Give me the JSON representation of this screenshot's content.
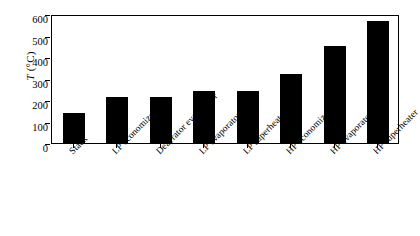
{
  "chart_data": {
    "type": "bar",
    "title": "",
    "subtitle": "",
    "xlabel": "",
    "ylabel": "T (°C)",
    "ylabel_symbol": "T",
    "ylabel_unit": " (°C)",
    "categories": [
      "Stack",
      "LP economizer",
      "Deaerator evaporator",
      "LP evaporator",
      "LP superheater",
      "HP economizer",
      "HP evaporator",
      "HP superheater"
    ],
    "values": [
      140,
      215,
      213,
      243,
      242,
      320,
      450,
      568
    ],
    "ylim": [
      0,
      600
    ],
    "yticks": [
      0,
      100,
      200,
      300,
      400,
      500,
      600
    ],
    "ytick_labels": [
      "0",
      "100",
      "200",
      "300",
      "400",
      "500",
      "600"
    ],
    "grid": false,
    "legend": false,
    "legend_position": "none",
    "bar_color": "#000000",
    "axis_color": "#000000",
    "background_color": "#ffffff",
    "xtick_label_rotation": -45
  }
}
